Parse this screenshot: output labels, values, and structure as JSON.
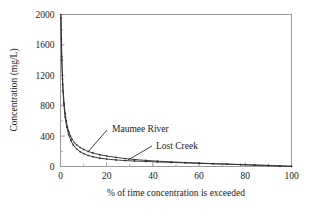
{
  "figure": {
    "background": "#ffffff",
    "axis_color": "#8a8a8a",
    "series_color": "#2b2b2b"
  },
  "chart_data": {
    "type": "line",
    "title": "",
    "subtitle": "",
    "xlabel": "% of time concentration is exceeded",
    "ylabel": "Concentration (mg/L)",
    "xlim": [
      0,
      100
    ],
    "ylim": [
      0,
      2000
    ],
    "xticks": [
      0,
      20,
      40,
      60,
      80,
      100
    ],
    "yticks": [
      0,
      400,
      800,
      1200,
      1600,
      2000
    ],
    "xtick_labels": [
      "0",
      "20",
      "40",
      "60",
      "80",
      "100"
    ],
    "ytick_labels": [
      "0",
      "400",
      "800",
      "1200",
      "1600",
      "2000"
    ],
    "minor_xticks": [
      10,
      30,
      50,
      70,
      90
    ],
    "grid": false,
    "legend_position": "inline-annotations",
    "markers": "small-dot",
    "series": [
      {
        "name": "Maumee River",
        "x": [
          0.2,
          0.4,
          0.6,
          0.9,
          1.2,
          1.6,
          2.0,
          2.5,
          3.0,
          3.6,
          4.3,
          5.0,
          6.0,
          7.0,
          8.5,
          10,
          12,
          14,
          17,
          20,
          24,
          28,
          32,
          37,
          42,
          48,
          54,
          60,
          66,
          72,
          78,
          84,
          90,
          95,
          100
        ],
        "y": [
          2000,
          1680,
          1400,
          1150,
          980,
          820,
          700,
          600,
          520,
          455,
          400,
          360,
          315,
          285,
          250,
          225,
          198,
          178,
          155,
          138,
          120,
          105,
          92,
          80,
          70,
          60,
          52,
          45,
          38,
          32,
          26,
          20,
          14,
          8,
          2
        ]
      },
      {
        "name": "Lost Creek",
        "x": [
          0.2,
          0.5,
          0.9,
          1.4,
          2.0,
          2.7,
          3.5,
          4.5,
          5.5,
          7.0,
          8.5,
          10,
          12,
          14,
          17,
          20,
          24,
          28,
          32,
          37,
          42,
          48,
          54,
          60,
          66,
          72,
          78,
          84,
          90,
          95,
          100
        ],
        "y": [
          1960,
          1450,
          1080,
          830,
          650,
          520,
          420,
          340,
          285,
          230,
          195,
          170,
          145,
          128,
          110,
          98,
          86,
          78,
          72,
          66,
          60,
          54,
          48,
          42,
          36,
          30,
          24,
          18,
          12,
          7,
          2
        ]
      }
    ],
    "annotations": [
      {
        "label": "Maumee River",
        "points_to_series": "Maumee River"
      },
      {
        "label": "Lost Creek",
        "points_to_series": "Lost Creek"
      }
    ]
  }
}
